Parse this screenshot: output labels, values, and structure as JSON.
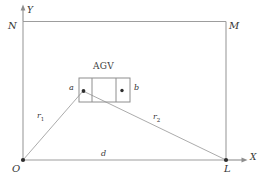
{
  "figure": {
    "type": "geometry-diagram",
    "background_color": "#ffffff",
    "line_color": "#9a9a9a",
    "text_color": "#343434"
  },
  "axes": {
    "x_axis_label": "X",
    "y_axis_label": "Y"
  },
  "vertices": {
    "origin": "O",
    "top_left": "N",
    "top_right": "M",
    "bottom_right": "L"
  },
  "agv": {
    "title": "AGV",
    "point_left_label": "a",
    "point_right_label": "b"
  },
  "segments": {
    "r1_label": "r",
    "r1_sub": "1",
    "r2_label": "r",
    "r2_sub": "2",
    "d_label": "d"
  }
}
